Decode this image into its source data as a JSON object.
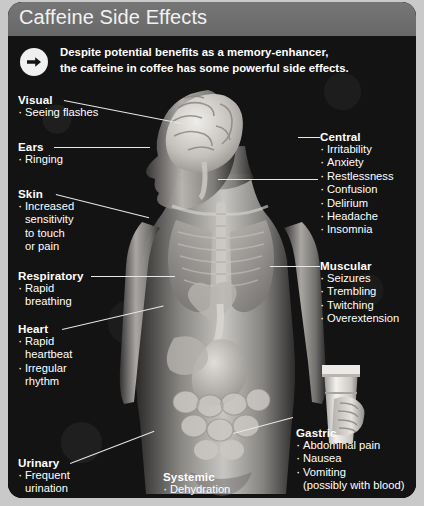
{
  "header": {
    "title": "Caffeine Side Effects"
  },
  "intro": {
    "icon": "arrow-right-circle-icon",
    "line1": "Despite potential benefits as a memory-enhancer,",
    "line2": "the caffeine in coffee has some powerful side effects."
  },
  "figure": {
    "name": "human-anatomy-diagram",
    "cup": "coffee-cup-in-hand"
  },
  "groups": [
    {
      "key": "visual",
      "heading": "Visual",
      "items": [
        "Seeing flashes"
      ]
    },
    {
      "key": "ears",
      "heading": "Ears",
      "items": [
        "Ringing"
      ]
    },
    {
      "key": "skin",
      "heading": "Skin",
      "items": [
        "Increased",
        "sensitivity",
        "to touch",
        "or pain"
      ]
    },
    {
      "key": "respiratory",
      "heading": "Respiratory",
      "items": [
        "Rapid",
        "breathing"
      ]
    },
    {
      "key": "heart",
      "heading": "Heart",
      "items": [
        "Rapid",
        "heartbeat",
        "Irregular",
        "rhythm"
      ]
    },
    {
      "key": "urinary",
      "heading": "Urinary",
      "items": [
        "Frequent",
        "urination"
      ]
    },
    {
      "key": "systemic",
      "heading": "Systemic",
      "items": [
        "Dehydration",
        "Fever"
      ]
    },
    {
      "key": "central",
      "heading": "Central",
      "items": [
        "Irritability",
        "Anxiety",
        "Restlessness",
        "Confusion",
        "Delirium",
        "Headache",
        "Insomnia"
      ]
    },
    {
      "key": "muscular",
      "heading": "Muscular",
      "items": [
        "Seizures",
        "Trembling",
        "Twitching",
        "Overextension"
      ]
    },
    {
      "key": "gastric",
      "heading": "Gastric",
      "items": [
        "Abdominal pain",
        "Nausea",
        "Vomiting",
        "(possibly with blood)"
      ]
    }
  ],
  "colors": {
    "title_bar": "#6e6e6e",
    "card_background": "#0d0c0c",
    "text": "#ffffff",
    "leader_line": "#e8e8e8",
    "page_background": "#c9c9c9"
  }
}
